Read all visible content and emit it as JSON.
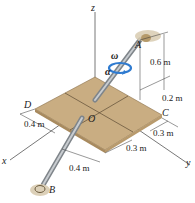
{
  "axes": {
    "x": "x",
    "y": "y",
    "z": "z"
  },
  "points": {
    "A": "A",
    "B": "B",
    "C": "C",
    "D": "D",
    "O": "O"
  },
  "symbols": {
    "omega": "ω",
    "alpha": "α"
  },
  "dimensions": {
    "a_height": "0.6 m",
    "a_offset": "0.2 m",
    "c_side": "0.3 m",
    "plate_y": "0.3 m",
    "d_side": "0.4 m",
    "b_side": "0.4 m"
  },
  "colors": {
    "plate": "#c9ad82",
    "plate_edge": "#8a6f48",
    "rod": "#a8acb0",
    "rotation_arrow": "#2f7bd0",
    "support": "#d8cbb0"
  }
}
